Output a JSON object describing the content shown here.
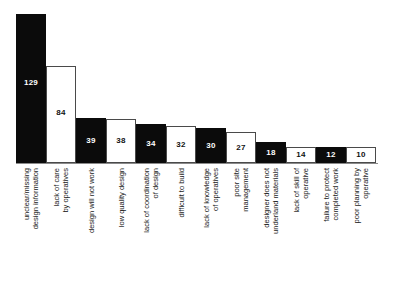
{
  "chart_data": {
    "type": "bar",
    "title": "",
    "subtitle": "",
    "xlabel": "",
    "ylabel": "",
    "ylim": [
      0,
      129
    ],
    "grid": false,
    "legend": null,
    "orientation": "vertical",
    "sorted": "descending",
    "categories": [
      "unclear/missing\ndesign information",
      "lack of care\nby operatives",
      "design will not work",
      "low quality design",
      "lack of coordination\nof design",
      "difficult to build",
      "lack of knowledge\nof operatives",
      "poor site\nmanagement",
      "designer does not\nunderland materials",
      "lack of skill of\noperative",
      "failure to protect\ncompleted work",
      "poor planning by\noperative"
    ],
    "values": [
      129,
      84,
      39,
      38,
      34,
      32,
      30,
      27,
      18,
      14,
      12,
      10
    ],
    "value_labels": [
      "129",
      "84",
      "39",
      "38",
      "34",
      "32",
      "30",
      "27",
      "18",
      "14",
      "12",
      "10"
    ],
    "bar_fills": [
      "dark",
      "light",
      "dark",
      "light",
      "dark",
      "light",
      "dark",
      "light",
      "dark",
      "light",
      "dark",
      "light"
    ],
    "colors": {
      "dark_bar": "#0b0b0b",
      "light_bar": "#ffffff",
      "bar_outline": "#4a4a4a",
      "baseline": "#8a8a8a",
      "label_text": "#1a1a1a",
      "value_on_dark": "#ffffff",
      "value_on_light": "#111111",
      "background": "#ffffff"
    }
  }
}
